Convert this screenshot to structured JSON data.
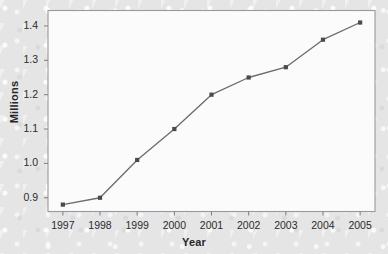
{
  "chart_data": {
    "type": "line",
    "title": "",
    "subtitle": "",
    "xlabel": "Year",
    "ylabel": "Millions",
    "x": [
      1997,
      1998,
      1999,
      2000,
      2001,
      2002,
      2003,
      2004,
      2005
    ],
    "categories": [
      "1997",
      "1998",
      "1999",
      "2000",
      "2001",
      "2002",
      "2003",
      "2004",
      "2005"
    ],
    "values": [
      0.88,
      0.9,
      1.01,
      1.1,
      1.2,
      1.25,
      1.28,
      1.36,
      1.41
    ],
    "series": [
      {
        "name": "Millions",
        "values": [
          0.88,
          0.9,
          1.01,
          1.1,
          1.2,
          1.25,
          1.28,
          1.36,
          1.41
        ]
      }
    ],
    "xlim": [
      1996.6,
      2005.4
    ],
    "ylim": [
      0.86,
      1.445
    ],
    "yticks": [
      0.9,
      1.0,
      1.1,
      1.2,
      1.3,
      1.4
    ],
    "ytick_labels": [
      "0.9",
      "1.0",
      "1.1",
      "1.2",
      "1.3",
      "1.4"
    ],
    "xticks": [
      1997,
      1998,
      1999,
      2000,
      2001,
      2002,
      2003,
      2004,
      2005
    ],
    "xtick_labels": [
      "1997",
      "1998",
      "1999",
      "2000",
      "2001",
      "2002",
      "2003",
      "2004",
      "2005"
    ],
    "grid": false,
    "legend": "none",
    "marker": "square",
    "line_color": "#6b6b70",
    "marker_color": "#4a4a50",
    "frame_color": "#9a9a9e",
    "plot_background": "#fbfbfb",
    "page_background": "#e8e8e8",
    "text_color": "#26262a"
  },
  "axis": {
    "y_title": "Millions",
    "x_title": "Year"
  }
}
